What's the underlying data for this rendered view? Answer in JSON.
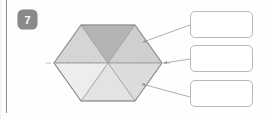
{
  "worksheet": {
    "question_number": "7",
    "badge_color": "#8a8a8a",
    "margin_rule_color": "#8c8c8c"
  },
  "figure": {
    "name": "hexagonal-prism-cube-diagonal-view",
    "outline_color": "#8e8e8e",
    "axis_line_style": "dash-dot",
    "axis_line_color": "#b0aeb0",
    "hexagon": {
      "center_x": 108,
      "center_y": 63,
      "radius_x": 54,
      "radius_y": 38
    },
    "faces": [
      {
        "name": "face-upper-left",
        "fill": "#d5d5d5"
      },
      {
        "name": "face-upper-right",
        "fill": "#b4b4b4"
      },
      {
        "name": "face-left",
        "fill": "#ededed"
      },
      {
        "name": "face-right",
        "fill": "#cfcfcf"
      },
      {
        "name": "face-lower-left",
        "fill": "#e3e3e3"
      },
      {
        "name": "face-lower-right",
        "fill": "#dcdcdc"
      }
    ]
  },
  "leaders": [
    {
      "name": "leader-line-top",
      "from_x": 143,
      "from_y": 42,
      "to_x": 190,
      "to_y": 25,
      "arrow": "at-figure"
    },
    {
      "name": "leader-line-middle",
      "from_x": 162,
      "from_y": 63,
      "to_x": 190,
      "to_y": 59,
      "arrow": "at-figure"
    },
    {
      "name": "leader-line-bottom",
      "from_x": 142,
      "from_y": 84,
      "to_x": 190,
      "to_y": 97,
      "arrow": "at-figure"
    }
  ],
  "answer_boxes": [
    {
      "name": "answer-box-1",
      "value": "",
      "placeholder": ""
    },
    {
      "name": "answer-box-2",
      "value": "",
      "placeholder": ""
    },
    {
      "name": "answer-box-3",
      "value": "",
      "placeholder": ""
    }
  ]
}
